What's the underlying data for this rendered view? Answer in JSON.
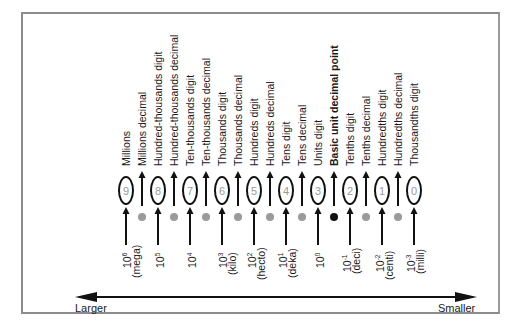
{
  "diagram": {
    "columns": [
      {
        "label": "Millions",
        "kind": "digit",
        "digit": "9",
        "exp_base": "10",
        "exp_power": "6",
        "prefix": "(mega)"
      },
      {
        "label": "Millions decimal",
        "kind": "decimal"
      },
      {
        "label": "Hundred-thousands digit",
        "kind": "digit",
        "digit": "8",
        "exp_base": "10",
        "exp_power": "5",
        "prefix": ""
      },
      {
        "label": "Hundred-thousands decimal",
        "kind": "decimal"
      },
      {
        "label": "Ten-thousands digit",
        "kind": "digit",
        "digit": "7",
        "exp_base": "10",
        "exp_power": "4",
        "prefix": ""
      },
      {
        "label": "Ten-thousands decimal",
        "kind": "decimal"
      },
      {
        "label": "Thousands digit",
        "kind": "digit",
        "digit": "6",
        "exp_base": "10",
        "exp_power": "3",
        "prefix": "(kilo)"
      },
      {
        "label": "Thousands decimal",
        "kind": "decimal"
      },
      {
        "label": "Hundreds digit",
        "kind": "digit",
        "digit": "5",
        "exp_base": "10",
        "exp_power": "2",
        "prefix": "(hecto)"
      },
      {
        "label": "Hundreds decimal",
        "kind": "decimal"
      },
      {
        "label": "Tens digit",
        "kind": "digit",
        "digit": "4",
        "exp_base": "10",
        "exp_power": "1",
        "prefix": "(deka)"
      },
      {
        "label": "Tens decimal",
        "kind": "decimal"
      },
      {
        "label": "Units digit",
        "kind": "digit",
        "digit": "3",
        "exp_base": "10",
        "exp_power": "0",
        "prefix": ""
      },
      {
        "label": "Basic unit decimal point",
        "kind": "decimal",
        "emphasis": true
      },
      {
        "label": "Tenths digit",
        "kind": "digit",
        "digit": "2",
        "exp_base": "10",
        "exp_power": "-1",
        "prefix": "(deci)"
      },
      {
        "label": "Tenths decimal",
        "kind": "decimal"
      },
      {
        "label": "Hundredths digit",
        "kind": "digit",
        "digit": "1",
        "exp_base": "10",
        "exp_power": "-2",
        "prefix": "(centi)"
      },
      {
        "label": "Hundredths decimal",
        "kind": "decimal"
      },
      {
        "label": "Thousandths digit",
        "kind": "digit",
        "digit": "0",
        "exp_base": "10",
        "exp_power": "-3",
        "prefix": "(milli)"
      }
    ],
    "scale": {
      "left_label": "Larger",
      "right_label": "Smaller"
    },
    "colors": {
      "frame": "#8c8c8c",
      "ink": "#111111",
      "digit_text": "#9a9a9a",
      "decimal_dot": "#9b9b9b",
      "basic_point_dot": "#111111"
    }
  }
}
